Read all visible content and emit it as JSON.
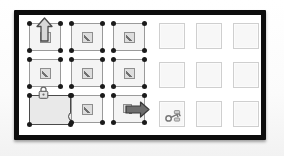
{
  "panel": {
    "name": "framed-canvas",
    "frame_color": "#0d0d0d",
    "canvas_color": "#ffffff"
  },
  "left_grid": {
    "name": "selected-widget-grid",
    "rows": 3,
    "columns": 3,
    "cell_color": "#f4f4f4",
    "cell_border_color": "#9a9a9a",
    "handle_color": "#1b1b1b",
    "cells": [
      {
        "row": 1,
        "col": 1,
        "icon": "edit-pencil-icon",
        "selected": true,
        "overlay": "arrow-up-icon"
      },
      {
        "row": 1,
        "col": 2,
        "icon": "edit-pencil-icon",
        "selected": true,
        "overlay": ""
      },
      {
        "row": 1,
        "col": 3,
        "icon": "edit-pencil-icon",
        "selected": true,
        "overlay": ""
      },
      {
        "row": 2,
        "col": 1,
        "icon": "edit-pencil-icon",
        "selected": true,
        "overlay": ""
      },
      {
        "row": 2,
        "col": 2,
        "icon": "edit-pencil-icon",
        "selected": true,
        "overlay": ""
      },
      {
        "row": 2,
        "col": 3,
        "icon": "edit-pencil-icon",
        "selected": true,
        "overlay": ""
      },
      {
        "row": 3,
        "col": 1,
        "icon": "",
        "selected": true,
        "overlay": "lock-icon"
      },
      {
        "row": 3,
        "col": 2,
        "icon": "edit-pencil-icon",
        "selected": true,
        "overlay": ""
      },
      {
        "row": 3,
        "col": 3,
        "icon": "edit-pencil-icon",
        "selected": true,
        "overlay": "arrow-right-icon"
      }
    ],
    "overlays": {
      "arrow_up": "arrow-up-icon",
      "arrow_right": "arrow-right-icon",
      "lock": "lock-icon",
      "resize_horizontal": "resize-horizontal-icon"
    }
  },
  "right_grid": {
    "name": "empty-placeholder-grid",
    "rows": 3,
    "columns": 3,
    "cell_color": "#f7f7f7",
    "cell_border_color": "#cfcfcf",
    "cells": [
      {
        "row": 1,
        "col": 1,
        "icon": ""
      },
      {
        "row": 1,
        "col": 2,
        "icon": ""
      },
      {
        "row": 1,
        "col": 3,
        "icon": ""
      },
      {
        "row": 2,
        "col": 1,
        "icon": ""
      },
      {
        "row": 2,
        "col": 2,
        "icon": ""
      },
      {
        "row": 2,
        "col": 3,
        "icon": ""
      },
      {
        "row": 3,
        "col": 1,
        "icon": "key-icon"
      },
      {
        "row": 3,
        "col": 2,
        "icon": ""
      },
      {
        "row": 3,
        "col": 3,
        "icon": ""
      }
    ]
  },
  "colors": {
    "frame": "#0d0d0d",
    "canvas": "#ffffff",
    "selected_fill": "#f4f4f4",
    "selected_border": "#9a9a9a",
    "handle": "#1b1b1b",
    "icon_dark": "#5b5b5b",
    "icon_mid": "#8e8e8e",
    "placeholder_fill": "#f7f7f7",
    "placeholder_border": "#cfcfcf"
  }
}
